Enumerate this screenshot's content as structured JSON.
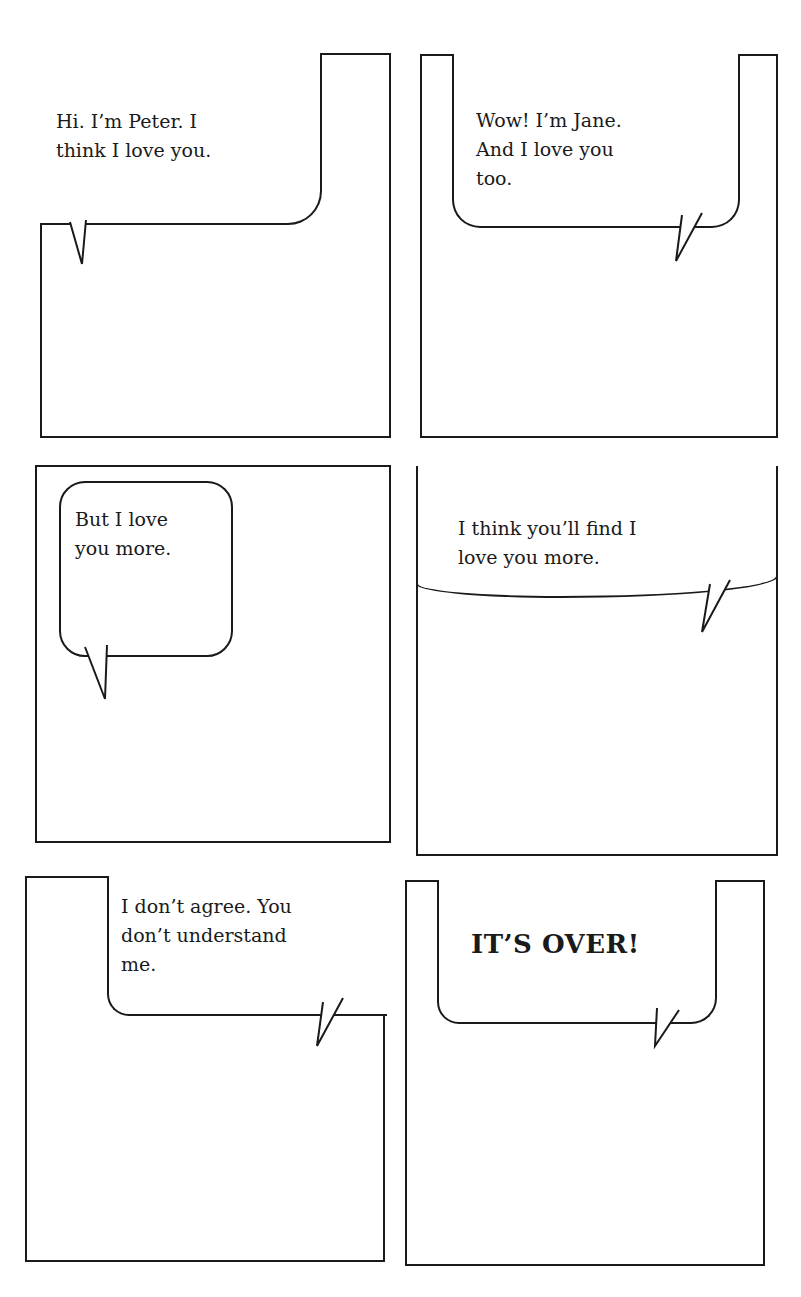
{
  "comic": {
    "layout": {
      "rows": 3,
      "columns": 2,
      "ink_color": "#1a1a1a",
      "paper_color": "#ffffff"
    },
    "panels": [
      {
        "index": 1,
        "speaker": "Peter",
        "text": "Hi. I’m Peter. I\nthink I love you."
      },
      {
        "index": 2,
        "speaker": "Jane",
        "text": "Wow! I’m Jane.\nAnd I love you\ntoo."
      },
      {
        "index": 3,
        "speaker": "Peter",
        "text": "But I love\nyou more."
      },
      {
        "index": 4,
        "speaker": "Jane",
        "text": "I think you’ll find I\nlove you more."
      },
      {
        "index": 5,
        "speaker": "Peter",
        "text": "I don’t agree. You\ndon’t understand\nme."
      },
      {
        "index": 6,
        "speaker": "Jane",
        "text": "IT’S OVER!"
      }
    ]
  }
}
